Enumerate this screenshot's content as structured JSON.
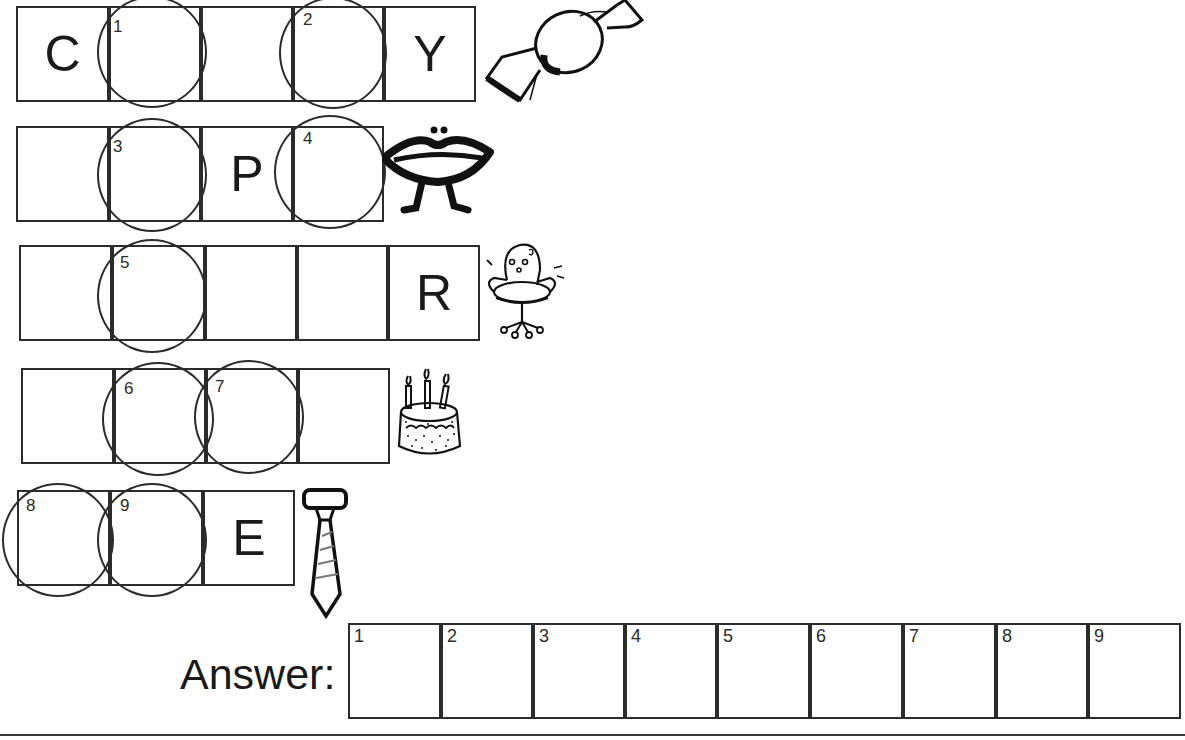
{
  "puzzle": {
    "rows": [
      {
        "id": "candy",
        "picture": "candy-icon",
        "cells": [
          {
            "x": 16,
            "y": 6,
            "w": 93,
            "h": 96,
            "letter": "C"
          },
          {
            "x": 109,
            "y": 6,
            "w": 92,
            "h": 96,
            "letter": ""
          },
          {
            "x": 201,
            "y": 6,
            "w": 92,
            "h": 96,
            "letter": ""
          },
          {
            "x": 293,
            "y": 6,
            "w": 91,
            "h": 96,
            "letter": ""
          },
          {
            "x": 384,
            "y": 6,
            "w": 92,
            "h": 96,
            "letter": "Y"
          }
        ]
      },
      {
        "id": "lips",
        "picture": "lips-icon",
        "cells": [
          {
            "x": 16,
            "y": 126,
            "w": 93,
            "h": 96,
            "letter": ""
          },
          {
            "x": 109,
            "y": 126,
            "w": 92,
            "h": 96,
            "letter": ""
          },
          {
            "x": 201,
            "y": 126,
            "w": 92,
            "h": 96,
            "letter": "P"
          },
          {
            "x": 293,
            "y": 126,
            "w": 91,
            "h": 96,
            "letter": ""
          }
        ]
      },
      {
        "id": "chair",
        "picture": "chair-icon",
        "cells": [
          {
            "x": 19,
            "y": 245,
            "w": 93,
            "h": 96,
            "letter": ""
          },
          {
            "x": 112,
            "y": 245,
            "w": 93,
            "h": 96,
            "letter": ""
          },
          {
            "x": 205,
            "y": 245,
            "w": 92,
            "h": 96,
            "letter": ""
          },
          {
            "x": 297,
            "y": 245,
            "w": 91,
            "h": 96,
            "letter": ""
          },
          {
            "x": 388,
            "y": 245,
            "w": 92,
            "h": 96,
            "letter": "R"
          }
        ]
      },
      {
        "id": "cake",
        "picture": "cake-icon",
        "cells": [
          {
            "x": 21,
            "y": 368,
            "w": 93,
            "h": 96,
            "letter": ""
          },
          {
            "x": 114,
            "y": 368,
            "w": 92,
            "h": 96,
            "letter": ""
          },
          {
            "x": 206,
            "y": 368,
            "w": 92,
            "h": 96,
            "letter": ""
          },
          {
            "x": 298,
            "y": 368,
            "w": 92,
            "h": 96,
            "letter": ""
          }
        ]
      },
      {
        "id": "tie",
        "picture": "tie-icon",
        "cells": [
          {
            "x": 17,
            "y": 490,
            "w": 93,
            "h": 96,
            "letter": ""
          },
          {
            "x": 110,
            "y": 490,
            "w": 93,
            "h": 96,
            "letter": ""
          },
          {
            "x": 203,
            "y": 490,
            "w": 92,
            "h": 96,
            "letter": "E"
          }
        ]
      }
    ],
    "circles": [
      {
        "n": "1",
        "cx": 152,
        "cy": 52,
        "rx": 55,
        "ry": 56,
        "nx": 113,
        "ny": 18
      },
      {
        "n": "2",
        "cx": 333,
        "cy": 53,
        "rx": 54,
        "ry": 56,
        "nx": 303,
        "ny": 11
      },
      {
        "n": "3",
        "cx": 152,
        "cy": 175,
        "rx": 55,
        "ry": 57,
        "nx": 113,
        "ny": 138
      },
      {
        "n": "4",
        "cx": 330,
        "cy": 172,
        "rx": 56,
        "ry": 57,
        "nx": 303,
        "ny": 130
      },
      {
        "n": "5",
        "cx": 152,
        "cy": 296,
        "rx": 55,
        "ry": 57,
        "nx": 120,
        "ny": 254
      },
      {
        "n": "6",
        "cx": 158,
        "cy": 419,
        "rx": 56,
        "ry": 57,
        "nx": 124,
        "ny": 380
      },
      {
        "n": "7",
        "cx": 249,
        "cy": 417,
        "rx": 55,
        "ry": 57,
        "nx": 215,
        "ny": 378
      },
      {
        "n": "8",
        "cx": 58,
        "cy": 540,
        "rx": 56,
        "ry": 57,
        "nx": 26,
        "ny": 497
      },
      {
        "n": "9",
        "cx": 152,
        "cy": 540,
        "rx": 55,
        "ry": 57,
        "nx": 120,
        "ny": 497
      }
    ]
  },
  "answer": {
    "label": "Answer:",
    "cells": [
      {
        "n": "1",
        "x": 348,
        "w": 93,
        "value": ""
      },
      {
        "n": "2",
        "x": 441,
        "w": 92,
        "value": ""
      },
      {
        "n": "3",
        "x": 533,
        "w": 92,
        "value": ""
      },
      {
        "n": "4",
        "x": 625,
        "w": 92,
        "value": ""
      },
      {
        "n": "5",
        "x": 717,
        "w": 93,
        "value": ""
      },
      {
        "n": "6",
        "x": 810,
        "w": 93,
        "value": ""
      },
      {
        "n": "7",
        "x": 903,
        "w": 93,
        "value": ""
      },
      {
        "n": "8",
        "x": 996,
        "w": 92,
        "value": ""
      },
      {
        "n": "9",
        "x": 1088,
        "w": 93,
        "value": ""
      }
    ]
  },
  "colors": {
    "ink": "#1a1a1a",
    "line": "#2b2b2b",
    "background": "#ffffff"
  }
}
